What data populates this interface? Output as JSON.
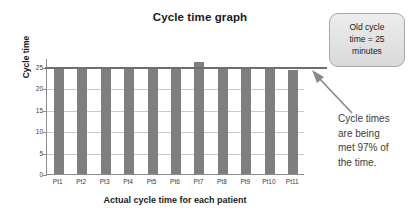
{
  "chart_data": {
    "type": "bar",
    "title": "Cycle time graph",
    "xlabel": "Actual cycle time for each patient",
    "ylabel": "Cycle time",
    "categories": [
      "Pt1",
      "Pt2",
      "Pt3",
      "Pt4",
      "Pt5",
      "Pt6",
      "Pt7",
      "Pt8",
      "Pt9",
      "Pt10",
      "Pt11"
    ],
    "values": [
      25,
      25,
      25,
      25,
      25,
      25,
      26,
      25,
      25,
      25,
      24.3
    ],
    "ylim": [
      0,
      27
    ],
    "yticks": [
      0,
      5,
      10,
      15,
      20,
      25
    ],
    "ytick_labels": [
      "0",
      "5",
      "10",
      "15",
      "20",
      "25"
    ],
    "grid": true,
    "legend": "none",
    "bar_color": "#7f7f7f",
    "reference_line": {
      "value": 25,
      "label": "Old cycle time = 25 minutes",
      "color": "#6e6e6e"
    },
    "annotations": [
      {
        "name": "old-cycle-time-callout",
        "text": "Old cycle\ntime = 25\nminutes"
      },
      {
        "name": "cycle-times-met-note",
        "text": "Cycle times\nare being\nmet 97% of\nthe time."
      }
    ]
  },
  "colors": {
    "bar": "#7f7f7f",
    "reference_line": "#6e6e6e",
    "axis": "#8d8d8d",
    "gridline": "#c9c9c9",
    "callout_border": "#a6a6a6",
    "callout_fill": "#e4e4e4",
    "text": "#231f20",
    "annotation_text": "#3d3d3d",
    "background": "#ffffff"
  }
}
